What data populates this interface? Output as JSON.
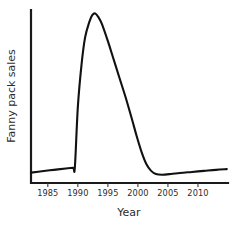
{
  "chart_data": {
    "type": "line",
    "title": "",
    "xlabel": "Year",
    "ylabel": "Fanny pack sales",
    "xlim": [
      1982.2,
      2015.0
    ],
    "ylim": [
      0,
      100
    ],
    "grid": false,
    "legend": null,
    "xticks": [
      "1985",
      "1990",
      "1995",
      "2000",
      "2005",
      "2010"
    ],
    "xtick_values": [
      1985,
      1990,
      1995,
      2000,
      2005,
      2010
    ],
    "yticks": [],
    "series": [
      {
        "name": "Fanny pack sales",
        "color": "#111111",
        "x": [
          1982.2,
          1984.0,
          1986.0,
          1988.0,
          1989.2,
          1989.5,
          1990.0,
          1990.6,
          1991.2,
          1991.9,
          1992.4,
          1992.9,
          1993.4,
          1994.0,
          1995.0,
          1996.0,
          1997.0,
          1998.0,
          1999.0,
          1999.8,
          2000.6,
          2001.4,
          2002.2,
          2003.0,
          2004.0,
          2005.5,
          2007.0,
          2009.0,
          2011.0,
          2013.0,
          2014.8
        ],
        "values": [
          6.0,
          6.8,
          7.6,
          8.4,
          8.8,
          9.0,
          44.0,
          68.0,
          84.0,
          93.0,
          97.0,
          98.0,
          96.0,
          92.0,
          82.0,
          71.0,
          60.0,
          49.0,
          37.0,
          27.0,
          18.0,
          11.0,
          7.0,
          5.2,
          4.8,
          5.2,
          5.8,
          6.4,
          7.0,
          7.6,
          8.0
        ]
      }
    ],
    "annotations": []
  },
  "axis": {
    "x_title": "Year",
    "y_title": "Fanny pack sales"
  }
}
